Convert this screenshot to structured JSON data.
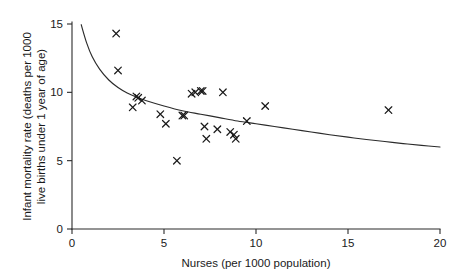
{
  "chart_data": {
    "type": "scatter",
    "title": "",
    "subtitle": "",
    "xlabel": "Nurses (per 1000 population)",
    "ylabel": "Infant mortality rate (deaths per 1000 live births under 1 year of age)",
    "ylabel_line1": "Infant mortality rate (deaths per 1000",
    "ylabel_line2": "live births under 1 year of age)",
    "xlim": [
      0,
      20
    ],
    "ylim": [
      0,
      15
    ],
    "xticks": [
      0,
      5,
      10,
      15,
      20
    ],
    "xtick_labels": [
      "0",
      "5",
      "10",
      "15",
      "20"
    ],
    "yticks": [
      0,
      5,
      10,
      15
    ],
    "ytick_labels": [
      "0",
      "5",
      "10",
      "15"
    ],
    "grid": false,
    "legend": null,
    "marker_style": "x",
    "marker_color": "#1a1a1a",
    "curve_color": "#2b2b2b",
    "axis_color": "#2b2b2b",
    "background_color": "#ffffff",
    "points": [
      {
        "x": 2.4,
        "y": 14.3
      },
      {
        "x": 2.5,
        "y": 11.6
      },
      {
        "x": 3.3,
        "y": 8.9
      },
      {
        "x": 3.5,
        "y": 9.7
      },
      {
        "x": 3.6,
        "y": 9.6
      },
      {
        "x": 3.8,
        "y": 9.4
      },
      {
        "x": 4.8,
        "y": 8.4
      },
      {
        "x": 5.1,
        "y": 7.7
      },
      {
        "x": 5.7,
        "y": 5.0
      },
      {
        "x": 6.0,
        "y": 8.3
      },
      {
        "x": 6.1,
        "y": 8.3
      },
      {
        "x": 6.5,
        "y": 9.9
      },
      {
        "x": 6.7,
        "y": 10.0
      },
      {
        "x": 7.0,
        "y": 10.1
      },
      {
        "x": 7.1,
        "y": 10.1
      },
      {
        "x": 7.2,
        "y": 7.5
      },
      {
        "x": 7.3,
        "y": 6.6
      },
      {
        "x": 7.9,
        "y": 7.3
      },
      {
        "x": 8.2,
        "y": 10.0
      },
      {
        "x": 8.6,
        "y": 7.1
      },
      {
        "x": 8.8,
        "y": 6.9
      },
      {
        "x": 8.9,
        "y": 6.6
      },
      {
        "x": 9.5,
        "y": 7.9
      },
      {
        "x": 10.5,
        "y": 9.0
      },
      {
        "x": 17.2,
        "y": 8.7
      }
    ],
    "fit_curve": {
      "description": "decreasing power/inverse trend line fitted through the scatter",
      "x_start": 0.5,
      "x_end": 20.0,
      "points": [
        {
          "x": 0.5,
          "y": 14.95
        },
        {
          "x": 0.8,
          "y": 13.6
        },
        {
          "x": 1.1,
          "y": 12.6
        },
        {
          "x": 1.5,
          "y": 11.7
        },
        {
          "x": 2.0,
          "y": 10.9
        },
        {
          "x": 2.5,
          "y": 10.35
        },
        {
          "x": 3.0,
          "y": 9.95
        },
        {
          "x": 3.5,
          "y": 9.65
        },
        {
          "x": 4.0,
          "y": 9.4
        },
        {
          "x": 5.0,
          "y": 9.0
        },
        {
          "x": 6.0,
          "y": 8.65
        },
        {
          "x": 7.0,
          "y": 8.4
        },
        {
          "x": 8.0,
          "y": 8.15
        },
        {
          "x": 9.0,
          "y": 7.9
        },
        {
          "x": 10.0,
          "y": 7.7
        },
        {
          "x": 11.0,
          "y": 7.5
        },
        {
          "x": 12.0,
          "y": 7.3
        },
        {
          "x": 13.0,
          "y": 7.1
        },
        {
          "x": 14.0,
          "y": 6.9
        },
        {
          "x": 15.0,
          "y": 6.72
        },
        {
          "x": 16.0,
          "y": 6.55
        },
        {
          "x": 17.0,
          "y": 6.4
        },
        {
          "x": 18.0,
          "y": 6.25
        },
        {
          "x": 19.0,
          "y": 6.12
        },
        {
          "x": 20.0,
          "y": 6.0
        }
      ]
    }
  }
}
